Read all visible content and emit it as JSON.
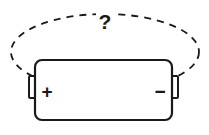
{
  "figure": {
    "name": "battery-with-unknown-field-diagram",
    "canvas": {
      "width": 209,
      "height": 135,
      "background": "#ffffff"
    },
    "stroke_color": "#1a1a1a",
    "fill_color": "#ffffff"
  },
  "battery": {
    "name": "battery-cell",
    "body": {
      "x": 35,
      "y": 60,
      "width": 137,
      "height": 60,
      "corner_radius": 7,
      "stroke_width": 2.2
    },
    "positive_terminal": {
      "label": "+",
      "symbol_name": "plus-sign",
      "nub": {
        "x": 29,
        "y": 76,
        "width": 6,
        "height": 22
      },
      "label_x": 47,
      "label_y": 91,
      "font_size": 19
    },
    "negative_terminal": {
      "label": "−",
      "symbol_name": "minus-sign",
      "nub": {
        "x": 172,
        "y": 76,
        "width": 6,
        "height": 22
      },
      "label_x": 160,
      "label_y": 91,
      "font_size": 19
    }
  },
  "field_loop": {
    "name": "dashed-field-ellipse",
    "cx": 105,
    "cy": 52,
    "rx": 94,
    "ry": 38,
    "stroke_width": 1.8,
    "dash_pattern": "7 6",
    "style": "dashed"
  },
  "annotation": {
    "name": "question-mark-label",
    "text": "?",
    "x": 105,
    "y": 21,
    "font_size": 21,
    "color": "#1a1a1a"
  }
}
